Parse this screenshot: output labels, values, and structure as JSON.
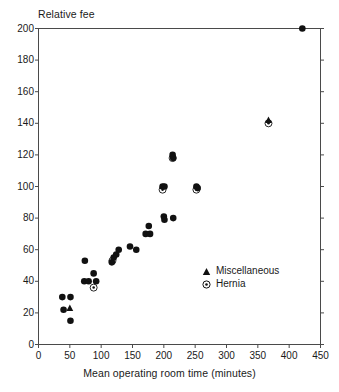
{
  "chart_data": {
    "type": "scatter",
    "title": "",
    "xlabel": "Mean operating room time (minutes)",
    "ylabel": "Relative fee",
    "xlim": [
      0,
      450
    ],
    "ylim": [
      0,
      200
    ],
    "xticks": [
      0,
      50,
      100,
      150,
      200,
      250,
      300,
      350,
      400,
      450
    ],
    "yticks": [
      0,
      20,
      40,
      60,
      80,
      100,
      120,
      140,
      160,
      180,
      200
    ],
    "grid": false,
    "legend_position": "inside-right-lower",
    "legend": [
      {
        "key": "miscellaneous",
        "label": "Miscellaneous",
        "marker": "filled-triangle"
      },
      {
        "key": "hernia",
        "label": "Hernia",
        "marker": "circled-dot"
      }
    ],
    "series": [
      {
        "name": "Procedures",
        "marker": "filled-circle",
        "color": "#111111",
        "points": [
          {
            "x": 38,
            "y": 30
          },
          {
            "x": 40,
            "y": 22
          },
          {
            "x": 51,
            "y": 30
          },
          {
            "x": 51,
            "y": 15
          },
          {
            "x": 74,
            "y": 53
          },
          {
            "x": 73,
            "y": 40
          },
          {
            "x": 80,
            "y": 40
          },
          {
            "x": 88,
            "y": 45
          },
          {
            "x": 92,
            "y": 40
          },
          {
            "x": 117,
            "y": 52
          },
          {
            "x": 120,
            "y": 55
          },
          {
            "x": 124,
            "y": 57
          },
          {
            "x": 128,
            "y": 60
          },
          {
            "x": 146,
            "y": 62
          },
          {
            "x": 156,
            "y": 60
          },
          {
            "x": 171,
            "y": 70
          },
          {
            "x": 176,
            "y": 75
          },
          {
            "x": 178,
            "y": 70
          },
          {
            "x": 198,
            "y": 100
          },
          {
            "x": 201,
            "y": 100
          },
          {
            "x": 200,
            "y": 81
          },
          {
            "x": 201,
            "y": 79
          },
          {
            "x": 214,
            "y": 120
          },
          {
            "x": 215,
            "y": 118
          },
          {
            "x": 215,
            "y": 80
          },
          {
            "x": 252,
            "y": 100
          },
          {
            "x": 254,
            "y": 99
          },
          {
            "x": 421,
            "y": 200
          }
        ]
      },
      {
        "name": "Miscellaneous",
        "marker": "filled-triangle",
        "color": "#111111",
        "points": [
          {
            "x": 50,
            "y": 23
          },
          {
            "x": 367,
            "y": 142
          }
        ]
      },
      {
        "name": "Hernia",
        "marker": "circled-dot",
        "color": "#111111",
        "points": [
          {
            "x": 88,
            "y": 36
          },
          {
            "x": 118,
            "y": 53
          },
          {
            "x": 198,
            "y": 98
          },
          {
            "x": 214,
            "y": 118
          },
          {
            "x": 252,
            "y": 98
          },
          {
            "x": 367,
            "y": 140
          }
        ]
      }
    ]
  },
  "axis": {
    "ylabel": "Relative fee",
    "xlabel": "Mean operating room time (minutes)",
    "ytick_labels": [
      "0",
      "20",
      "40",
      "60",
      "80",
      "100",
      "120",
      "140",
      "160",
      "180",
      "200"
    ],
    "xtick_labels": [
      "0",
      "50",
      "100",
      "150",
      "200",
      "250",
      "300",
      "350",
      "400",
      "450"
    ]
  },
  "legend": {
    "miscellaneous_label": "Miscellaneous",
    "hernia_label": "Hernia"
  },
  "colors": {
    "marker": "#111111",
    "axis": "#4a4a4a",
    "text": "#1a1a1a",
    "background": "#ffffff"
  }
}
